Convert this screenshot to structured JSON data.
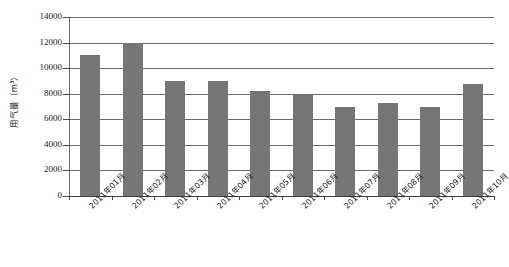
{
  "chart_data": {
    "type": "bar",
    "title": "",
    "subtitle": "",
    "xlabel": "",
    "ylabel": "用气量（m³）",
    "categories": [
      "2011年01月",
      "2011年02月",
      "2011年03月",
      "2011年04月",
      "2011年05月",
      "2011年06月",
      "2011年07月",
      "2011年08月",
      "2011年09月",
      "2011年10月"
    ],
    "values": [
      11000,
      12000,
      9000,
      9000,
      8200,
      7900,
      7000,
      7300,
      7000,
      8800
    ],
    "ylim": [
      0,
      14000
    ],
    "ytick_values": [
      0,
      2000,
      4000,
      6000,
      8000,
      10000,
      12000,
      14000
    ],
    "ytick_labels": [
      "0",
      "2000",
      "4000",
      "6000",
      "8000",
      "10000",
      "12000",
      "14000"
    ],
    "grid": true,
    "legend": false,
    "legend_position": "none",
    "series_color": "#767676",
    "axis_color": "#6b6b6b",
    "text_color": "#1a1a1a"
  }
}
